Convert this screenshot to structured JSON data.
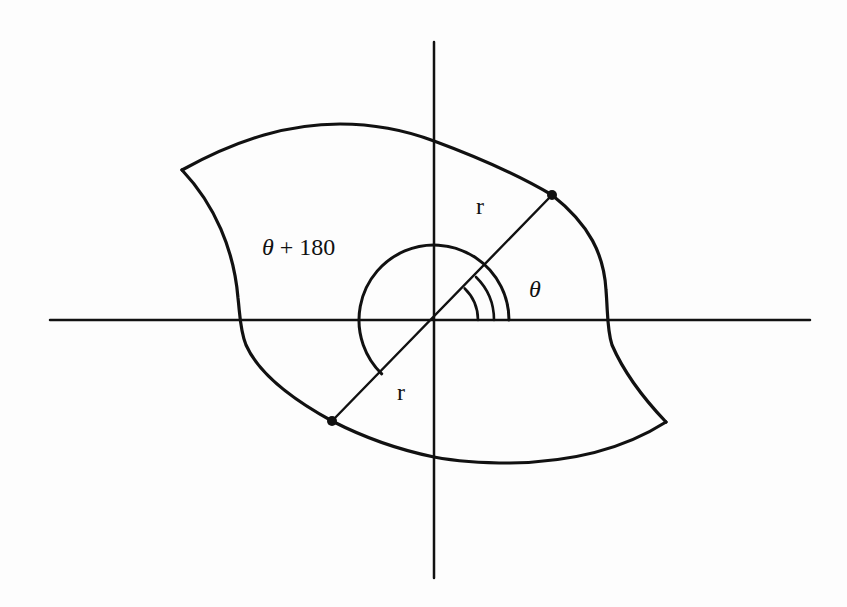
{
  "figure": {
    "type": "polar-coordinates-region-diagram",
    "colors": {
      "ink": "#111111",
      "background": "#fdfdfd"
    },
    "axes": {
      "origin": [
        434,
        320
      ],
      "horizontal": {
        "x1": 50,
        "x2": 810,
        "y": 320
      },
      "vertical": {
        "x": 434,
        "y1": 42,
        "y2": 578
      }
    },
    "points": [
      {
        "name": "point-r-theta",
        "x": 552,
        "y": 195
      },
      {
        "name": "point-r-theta-plus-180",
        "x": 332,
        "y": 421
      }
    ],
    "labels": {
      "theta_plus_180": {
        "theta": "θ",
        "rest": " + 180"
      },
      "theta": "θ",
      "r_upper": "r",
      "r_lower": "r"
    }
  }
}
